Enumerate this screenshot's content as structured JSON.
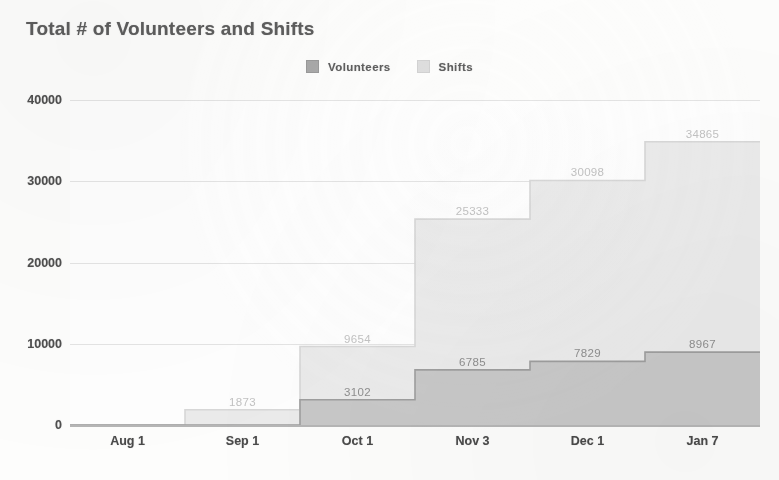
{
  "chart_data": {
    "type": "area",
    "title": "Total # of Volunteers and Shifts",
    "xlabel": "",
    "ylabel": "",
    "categories": [
      "Aug 1",
      "Sep 1",
      "Oct 1",
      "Nov 3",
      "Dec 1",
      "Jan 7"
    ],
    "series": [
      {
        "name": "Shifts",
        "color": "#ebebeb",
        "line_color": "#d8d8d8",
        "label_color": "#c3c3c3",
        "values": [
          0,
          1873,
          9654,
          25333,
          30098,
          34865
        ],
        "labels": [
          "",
          "1873",
          "9654",
          "25333",
          "30098",
          "34865"
        ]
      },
      {
        "name": "Volunteers",
        "color": "#c8c8c8",
        "line_color": "#9e9e9e",
        "label_color": "#8e8e8e",
        "values": [
          0,
          0,
          3102,
          6785,
          7829,
          8967
        ],
        "labels": [
          "",
          "",
          "3102",
          "6785",
          "7829",
          "8967"
        ]
      }
    ],
    "yticks": [
      "0",
      "10000",
      "20000",
      "30000",
      "40000"
    ],
    "ytick_values": [
      0,
      10000,
      20000,
      30000,
      40000
    ],
    "ylim": [
      0,
      40000
    ],
    "grid": true,
    "legend_position": "top-center",
    "step_style": "post"
  },
  "legend": {
    "items": [
      {
        "label": "Volunteers",
        "swatch": "dark-square-icon"
      },
      {
        "label": "Shifts",
        "swatch": "light-square-icon"
      }
    ]
  },
  "colors": {
    "title": "#5d5d5d",
    "axis_text": "#4a4a4a",
    "grid": "#e4e4e4",
    "baseline": "#b6b6b6",
    "background": "#fdfdfc"
  }
}
